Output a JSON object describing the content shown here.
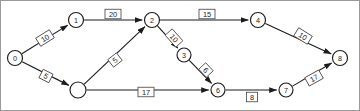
{
  "diagram": {
    "type": "directed-weighted-graph",
    "title": "",
    "canvas": {
      "width": 360,
      "height": 111
    },
    "nodes": [
      {
        "id": "0",
        "label": "0",
        "x": 15,
        "y": 58,
        "r": 7.5
      },
      {
        "id": "1",
        "label": "1",
        "x": 76,
        "y": 20,
        "r": 7.5
      },
      {
        "id": "2",
        "label": "2",
        "x": 152,
        "y": 20,
        "r": 7.5
      },
      {
        "id": "3",
        "label": "3",
        "x": 184,
        "y": 55,
        "r": 7.0
      },
      {
        "id": "4",
        "label": "4",
        "x": 258,
        "y": 20,
        "r": 7.5
      },
      {
        "id": "5",
        "label": "",
        "x": 78,
        "y": 90,
        "r": 8.0
      },
      {
        "id": "6",
        "label": "6",
        "x": 218,
        "y": 90,
        "r": 7.0
      },
      {
        "id": "7",
        "label": "7",
        "x": 286,
        "y": 90,
        "r": 7.0
      },
      {
        "id": "8",
        "label": "8",
        "x": 340,
        "y": 58,
        "r": 7.5
      }
    ],
    "edges": [
      {
        "id": "e-0-1",
        "from": "0",
        "to": "1",
        "weight": "10",
        "lx": 45,
        "ly": 38,
        "rot": -32
      },
      {
        "id": "e-0-5",
        "from": "0",
        "to": "5",
        "weight": "5",
        "lx": 46,
        "ly": 76,
        "rot": 27
      },
      {
        "id": "e-1-2",
        "from": "1",
        "to": "2",
        "weight": "20",
        "lx": 113,
        "ly": 14,
        "rot": 0
      },
      {
        "id": "e-5-2",
        "from": "5",
        "to": "2",
        "weight": "5",
        "lx": 115,
        "ly": 60,
        "rot": -38
      },
      {
        "id": "e-5-6",
        "from": "5",
        "to": "6",
        "weight": "17",
        "lx": 146,
        "ly": 92,
        "rot": 0
      },
      {
        "id": "e-2-3",
        "from": "2",
        "to": "3",
        "weight": "10",
        "lx": 174,
        "ly": 38,
        "rot": 48
      },
      {
        "id": "e-2-4",
        "from": "2",
        "to": "4",
        "weight": "15",
        "lx": 207,
        "ly": 14,
        "rot": 0
      },
      {
        "id": "e-3-6",
        "from": "3",
        "to": "6",
        "weight": "6",
        "lx": 206,
        "ly": 70,
        "rot": 47
      },
      {
        "id": "e-4-8",
        "from": "4",
        "to": "8",
        "weight": "10",
        "lx": 303,
        "ly": 36,
        "rot": 32
      },
      {
        "id": "e-6-7",
        "from": "6",
        "to": "7",
        "weight": "8",
        "lx": 252,
        "ly": 97,
        "rot": 0
      },
      {
        "id": "e-7-8",
        "from": "7",
        "to": "8",
        "weight": "17",
        "lx": 314,
        "ly": 78,
        "rot": -29
      }
    ]
  }
}
